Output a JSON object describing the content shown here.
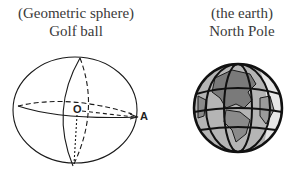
{
  "left_figure": {
    "subtitle": "(Geometric sphere)",
    "title": "Golf ball",
    "center_label": "O",
    "point_label": "A"
  },
  "right_figure": {
    "subtitle": "(the earth)",
    "title": "North Pole"
  },
  "colors": {
    "text": "#3a3a3a",
    "line": "#1a1a1a",
    "globe_land": "#7a7a7a",
    "globe_ocean": "#b5b5b5",
    "globe_highlight": "#e6e6e6"
  }
}
